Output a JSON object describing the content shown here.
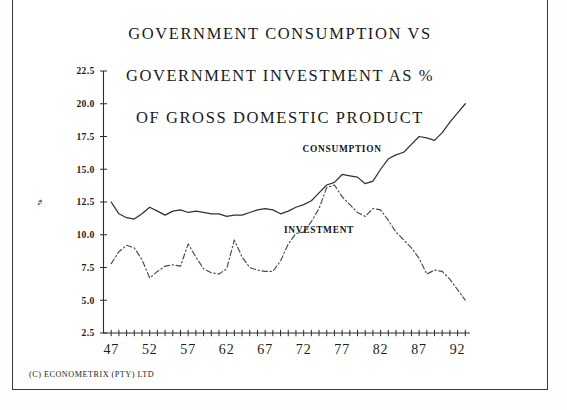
{
  "chart_data": {
    "type": "line",
    "title": "GOVERNMENT CONSUMPTION VS GOVERNMENT INVESTMENT AS % OF GROSS DOMESTIC PRODUCT",
    "title_lines": [
      "GOVERNMENT CONSUMPTION VS",
      "GOVERNMENT INVESTMENT AS %",
      "OF GROSS DOMESTIC PRODUCT"
    ],
    "xlabel": "",
    "ylabel": "%",
    "ylim": [
      2.5,
      22.5
    ],
    "yticks": [
      2.5,
      5.0,
      7.5,
      10.0,
      12.5,
      15.0,
      17.5,
      20.0,
      22.5
    ],
    "ytick_labels": [
      "2.5",
      "5.0",
      "7.5",
      "10.0",
      "12.5",
      "15.0",
      "17.5",
      "20.0",
      "22.5"
    ],
    "xlim": [
      1946,
      1994
    ],
    "xticks": [
      1947,
      1952,
      1957,
      1962,
      1967,
      1972,
      1977,
      1982,
      1987,
      1992
    ],
    "xtick_labels": [
      "47",
      "52",
      "57",
      "62",
      "67",
      "72",
      "77",
      "82",
      "87",
      "92"
    ],
    "minor_xtick_interval": 1,
    "grid": false,
    "legend_position": "inline-annotation",
    "x": [
      1947,
      1948,
      1949,
      1950,
      1951,
      1952,
      1953,
      1954,
      1955,
      1956,
      1957,
      1958,
      1959,
      1960,
      1961,
      1962,
      1963,
      1964,
      1965,
      1966,
      1967,
      1968,
      1969,
      1970,
      1971,
      1972,
      1973,
      1974,
      1975,
      1976,
      1977,
      1978,
      1979,
      1980,
      1981,
      1982,
      1983,
      1984,
      1985,
      1986,
      1987,
      1988,
      1989,
      1990,
      1991,
      1992,
      1993
    ],
    "series": [
      {
        "name": "CONSUMPTION",
        "style": "solid",
        "label_x": 1977,
        "label_y": 16.3,
        "values": [
          12.5,
          11.6,
          11.3,
          11.2,
          11.6,
          12.1,
          11.8,
          11.5,
          11.8,
          11.9,
          11.7,
          11.8,
          11.7,
          11.6,
          11.6,
          11.4,
          11.5,
          11.5,
          11.7,
          11.9,
          12.0,
          11.9,
          11.6,
          11.8,
          12.1,
          12.3,
          12.6,
          13.2,
          13.8,
          14.0,
          14.6,
          14.5,
          14.4,
          13.9,
          14.1,
          15.0,
          15.8,
          16.1,
          16.3,
          16.9,
          17.5,
          17.4,
          17.2,
          17.8,
          18.6,
          19.3,
          20.0
        ]
      },
      {
        "name": "INVESTMENT",
        "style": "dash-dot",
        "label_x": 1974,
        "label_y": 10.1,
        "values": [
          7.8,
          8.7,
          9.2,
          9.0,
          8.1,
          6.7,
          7.2,
          7.6,
          7.7,
          7.6,
          9.3,
          8.3,
          7.4,
          7.1,
          7.0,
          7.4,
          9.6,
          8.3,
          7.5,
          7.3,
          7.2,
          7.2,
          8.0,
          9.3,
          10.1,
          10.2,
          11.0,
          12.0,
          13.6,
          13.8,
          12.9,
          12.3,
          11.7,
          11.4,
          12.0,
          11.9,
          11.1,
          10.2,
          9.6,
          9.0,
          8.2,
          7.0,
          7.3,
          7.2,
          6.6,
          5.8,
          5.0
        ]
      }
    ]
  },
  "footer": {
    "credit": "(C) ECONOMETRIX (PTY) LTD"
  }
}
